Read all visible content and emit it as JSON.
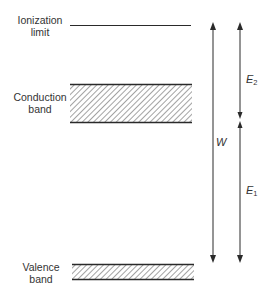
{
  "diagram": {
    "type": "energy-band-diagram",
    "levels": [
      {
        "id": "ionization",
        "label_line1": "Ionization",
        "label_line2": "limit"
      },
      {
        "id": "conduction",
        "label_line1": "Conduction",
        "label_line2": "band"
      },
      {
        "id": "valence",
        "label_line1": "Valence",
        "label_line2": "band"
      }
    ],
    "arrows": [
      {
        "id": "W",
        "symbol": "W",
        "subscript": "",
        "from": "valence",
        "to": "ionization",
        "direction": "double-headed"
      },
      {
        "id": "E2",
        "symbol": "E",
        "subscript": "2",
        "from": "conduction",
        "to": "ionization",
        "direction": "double-headed"
      },
      {
        "id": "E1",
        "symbol": "E",
        "subscript": "1",
        "from": "valence",
        "to": "conduction",
        "direction": "double-headed"
      }
    ],
    "colors": {
      "line": "#2a2a2a",
      "hatch": "#555555",
      "background": "#ffffff"
    }
  }
}
